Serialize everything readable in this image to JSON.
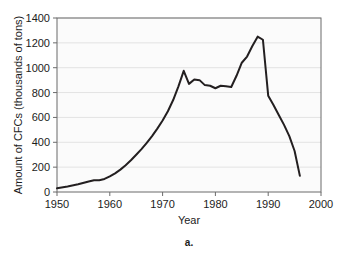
{
  "figure": {
    "caption": "a.",
    "background_color": "#ffffff",
    "plot_background_color": "#fbfbfb",
    "frame_color": "#6b6b6b",
    "gridline_color": "#e3e3e3",
    "line_color": "#231f20"
  },
  "chart_data": {
    "type": "line",
    "title": "",
    "xlabel": "Year",
    "ylabel": "Amount of CFCs (thousands of tons)",
    "xlim": [
      1950,
      2000
    ],
    "ylim": [
      0,
      1400
    ],
    "xticks": [
      1950,
      1960,
      1970,
      1980,
      1990,
      2000
    ],
    "yticks": [
      0,
      200,
      400,
      600,
      800,
      1000,
      1200,
      1400
    ],
    "xtick_labels": [
      "1950",
      "1960",
      "1970",
      "1980",
      "1990",
      "2000"
    ],
    "ytick_labels": [
      "0",
      "200",
      "400",
      "600",
      "800",
      "1000",
      "1200",
      "1400"
    ],
    "grid": "horizontal",
    "legend": "none",
    "series": [
      {
        "name": "CFC production",
        "x": [
          1950,
          1952,
          1954,
          1956,
          1957,
          1958,
          1959,
          1960,
          1961,
          1962,
          1963,
          1964,
          1965,
          1966,
          1967,
          1968,
          1969,
          1970,
          1971,
          1972,
          1973,
          1974,
          1975,
          1976,
          1977,
          1978,
          1979,
          1980,
          1981,
          1982,
          1983,
          1984,
          1985,
          1986,
          1987,
          1988,
          1989,
          1990,
          1991,
          1992,
          1993,
          1994,
          1995,
          1996
        ],
        "y": [
          30,
          45,
          62,
          85,
          95,
          95,
          105,
          125,
          150,
          180,
          215,
          255,
          300,
          345,
          395,
          450,
          510,
          575,
          650,
          740,
          850,
          975,
          870,
          905,
          900,
          860,
          855,
          835,
          855,
          850,
          845,
          935,
          1040,
          1090,
          1175,
          1250,
          1225,
          775,
          700,
          620,
          540,
          450,
          330,
          130
        ]
      }
    ],
    "annotations": []
  }
}
